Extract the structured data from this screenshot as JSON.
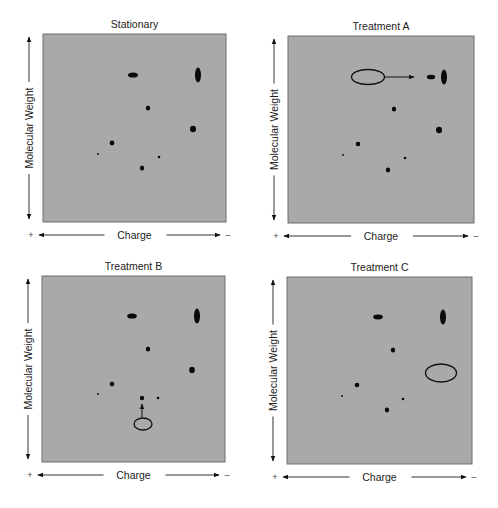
{
  "figure": {
    "colors": {
      "panel_fill": "#a9a9a9",
      "panel_border": "#6e6e6e",
      "spot": "#0a0a0a",
      "annotation": "#111111",
      "axis": "#333333"
    },
    "axis_labels": {
      "y": "Molecular Weight",
      "x": "Charge",
      "x_left_sign": "+",
      "x_right_sign": "–"
    },
    "panels": [
      {
        "id": "stationary",
        "title": "Stationary",
        "box": {
          "x": 43,
          "y": 34,
          "w": 183,
          "h": 188
        },
        "spots": [
          {
            "cx": 133,
            "cy": 75,
            "rx": 5,
            "ry": 2.6
          },
          {
            "cx": 198,
            "cy": 75,
            "rx": 3,
            "ry": 7.5
          },
          {
            "cx": 148,
            "cy": 108,
            "rx": 2.2,
            "ry": 2.6
          },
          {
            "cx": 193,
            "cy": 129,
            "rx": 3,
            "ry": 3.3
          },
          {
            "cx": 112,
            "cy": 143,
            "rx": 2.4,
            "ry": 2.4
          },
          {
            "cx": 98,
            "cy": 154,
            "rx": 0.9,
            "ry": 0.9
          },
          {
            "cx": 159,
            "cy": 157,
            "rx": 1.3,
            "ry": 1.3
          },
          {
            "cx": 142,
            "cy": 168,
            "rx": 2.2,
            "ry": 2.5
          }
        ],
        "annotations": []
      },
      {
        "id": "treatment-a",
        "title": "Treatment A",
        "box": {
          "x": 288,
          "y": 36,
          "w": 186,
          "h": 187
        },
        "spots": [
          {
            "cx": 431,
            "cy": 77,
            "rx": 4.2,
            "ry": 2.3
          },
          {
            "cx": 444,
            "cy": 77,
            "rx": 3,
            "ry": 7.5
          },
          {
            "cx": 394,
            "cy": 109,
            "rx": 2.2,
            "ry": 2.6
          },
          {
            "cx": 439,
            "cy": 130,
            "rx": 3,
            "ry": 3.3
          },
          {
            "cx": 358,
            "cy": 144,
            "rx": 2.3,
            "ry": 2.3
          },
          {
            "cx": 343,
            "cy": 155,
            "rx": 0.9,
            "ry": 0.9
          },
          {
            "cx": 405,
            "cy": 158,
            "rx": 1.3,
            "ry": 1.3
          },
          {
            "cx": 388,
            "cy": 170,
            "rx": 2.2,
            "ry": 2.4
          }
        ],
        "annotations": [
          {
            "type": "oval",
            "cx": 368,
            "cy": 77,
            "rx": 16.5,
            "ry": 7.5
          },
          {
            "type": "arrow",
            "x1": 385,
            "y1": 77,
            "x2": 414,
            "y2": 77
          }
        ]
      },
      {
        "id": "treatment-b",
        "title": "Treatment B",
        "box": {
          "x": 42,
          "y": 276,
          "w": 183,
          "h": 186
        },
        "spots": [
          {
            "cx": 132,
            "cy": 316,
            "rx": 4.8,
            "ry": 2.6
          },
          {
            "cx": 197,
            "cy": 316,
            "rx": 3,
            "ry": 7.5
          },
          {
            "cx": 148,
            "cy": 349,
            "rx": 2.2,
            "ry": 2.6
          },
          {
            "cx": 192,
            "cy": 370,
            "rx": 2.8,
            "ry": 3.2
          },
          {
            "cx": 112,
            "cy": 384,
            "rx": 2.3,
            "ry": 2.3
          },
          {
            "cx": 98,
            "cy": 394,
            "rx": 0.9,
            "ry": 0.9
          },
          {
            "cx": 142,
            "cy": 398,
            "rx": 2.2,
            "ry": 2.3
          },
          {
            "cx": 158,
            "cy": 398,
            "rx": 1.3,
            "ry": 1.3
          }
        ],
        "annotations": [
          {
            "type": "oval",
            "cx": 143,
            "cy": 424,
            "rx": 9,
            "ry": 6
          },
          {
            "type": "arrow",
            "x1": 142,
            "y1": 417,
            "x2": 142,
            "y2": 404
          }
        ]
      },
      {
        "id": "treatment-c",
        "title": "Treatment C",
        "box": {
          "x": 287,
          "y": 277,
          "w": 185,
          "h": 187
        },
        "spots": [
          {
            "cx": 378,
            "cy": 317,
            "rx": 4.8,
            "ry": 2.4
          },
          {
            "cx": 443,
            "cy": 317,
            "rx": 3,
            "ry": 7.5
          },
          {
            "cx": 393,
            "cy": 350,
            "rx": 2.2,
            "ry": 2.6
          },
          {
            "cx": 357,
            "cy": 385,
            "rx": 2.3,
            "ry": 2.3
          },
          {
            "cx": 342,
            "cy": 396,
            "rx": 0.9,
            "ry": 0.9
          },
          {
            "cx": 403,
            "cy": 399,
            "rx": 1.3,
            "ry": 1.3
          },
          {
            "cx": 387,
            "cy": 410,
            "rx": 2.2,
            "ry": 2.4
          }
        ],
        "annotations": [
          {
            "type": "oval",
            "cx": 441,
            "cy": 373,
            "rx": 15.5,
            "ry": 9
          }
        ]
      }
    ]
  }
}
